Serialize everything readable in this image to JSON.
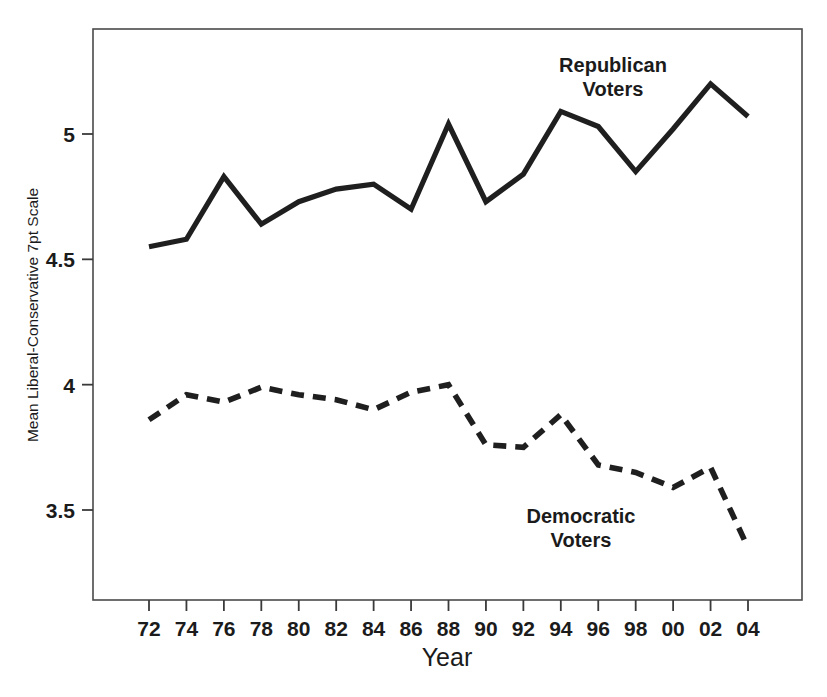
{
  "chart_data": {
    "type": "line",
    "title": "",
    "xlabel": "Year",
    "ylabel": "Mean Liberal-Conservative 7pt Scale",
    "x": [
      1972,
      1974,
      1976,
      1978,
      1980,
      1982,
      1984,
      1986,
      1988,
      1990,
      1992,
      1994,
      1996,
      1998,
      2000,
      2002,
      2004
    ],
    "categories": [
      "72",
      "74",
      "76",
      "78",
      "80",
      "82",
      "84",
      "86",
      "88",
      "90",
      "92",
      "94",
      "96",
      "98",
      "00",
      "02",
      "04"
    ],
    "xtick_labels": [
      "72",
      "74",
      "76",
      "78",
      "80",
      "82",
      "84",
      "86",
      "88",
      "90",
      "92",
      "94",
      "96",
      "98",
      "00",
      "02",
      "04"
    ],
    "ytick_labels": [
      "5",
      "4.5",
      "4",
      "3.5"
    ],
    "ytick_values": [
      5,
      4.5,
      4,
      3.5
    ],
    "ylim": [
      3.31,
      5.38
    ],
    "xlim": [
      1970.6,
      2006.4
    ],
    "grid": false,
    "legend_position": "inline-annotation",
    "series": [
      {
        "name": "Republican Voters",
        "style": "solid",
        "color": "#1f1f1f",
        "label_text_line1": "Republican",
        "label_text_line2": "Voters",
        "values": [
          4.55,
          4.58,
          4.83,
          4.64,
          4.73,
          4.78,
          4.8,
          4.7,
          5.04,
          4.73,
          4.84,
          5.09,
          5.03,
          4.85,
          5.02,
          5.2,
          5.07
        ]
      },
      {
        "name": "Democratic Voters",
        "style": "dashed",
        "color": "#1f1f1f",
        "label_text_line1": "Democratic",
        "label_text_line2": "Voters",
        "values": [
          3.86,
          3.96,
          3.93,
          3.99,
          3.96,
          3.94,
          3.9,
          3.97,
          4.0,
          3.76,
          3.75,
          3.88,
          3.68,
          3.65,
          3.59,
          3.67,
          3.35
        ]
      }
    ]
  },
  "annotations": {
    "republican": {
      "line1": "Republican",
      "line2": "Voters"
    },
    "democratic": {
      "line1": "Democratic",
      "line2": "Voters"
    }
  },
  "axes": {
    "x_title": "Year",
    "y_title": "Mean Liberal-Conservative 7pt Scale"
  }
}
